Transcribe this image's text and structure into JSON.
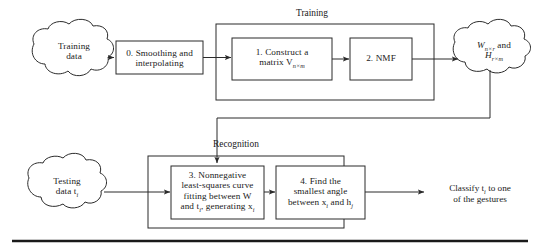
{
  "figure": {
    "stroke_color": "#2b2b2b",
    "background": "#ffffff",
    "rule_color": "#1a1a1a"
  },
  "groups": {
    "training": {
      "label": "Training"
    },
    "recognition": {
      "label": "Recognition"
    }
  },
  "clouds": {
    "training_data": {
      "line1": "Training",
      "line2": "data"
    },
    "wh": {
      "line1_main": "W",
      "line1_sub": "n×r",
      "line1_tail": " and",
      "line2_main": "H",
      "line2_sub": "r×m"
    },
    "testing_data": {
      "line1": "Testing",
      "line2_main": "data t",
      "line2_sub": "i"
    }
  },
  "boxes": {
    "step0": {
      "line1": "0. Smoothing and",
      "line2": "interpolating"
    },
    "step1": {
      "line1": "1. Construct a",
      "line2_main": "matrix V",
      "line2_sub": "n×m"
    },
    "step2": {
      "line1": "2. NMF"
    },
    "step3": {
      "line1": "3. Nonnegative",
      "line2": "least-squares curve",
      "line3_main": "fitting between W",
      "line4_a": "and t",
      "line4_sub_a": "i",
      "line4_b": ", generating x",
      "line4_sub_b": "i"
    },
    "step4": {
      "line1": "4. Find the",
      "line2": "smallest angle",
      "line3_a": "between x",
      "line3_sub_a": "i",
      "line3_b": " and h",
      "line3_sub_b": "j"
    }
  },
  "output": {
    "line1_a": "Classify t",
    "line1_sub": "i",
    "line1_b": " to one",
    "line2": "of the gestures"
  }
}
